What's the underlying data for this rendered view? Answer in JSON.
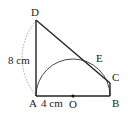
{
  "diagram": {
    "points": {
      "D": {
        "label": "D",
        "x": 36,
        "y": 20
      },
      "A": {
        "label": "A",
        "x": 36,
        "y": 96
      },
      "B": {
        "label": "B",
        "x": 110,
        "y": 96
      },
      "O": {
        "label": "O",
        "x": 73,
        "y": 96
      },
      "C": {
        "label": "C",
        "x": 110,
        "y": 83
      },
      "E": {
        "label": "E",
        "x": 95,
        "y": 63
      }
    },
    "measurements": {
      "AD": "8 cm",
      "AO": "4 cm"
    },
    "colors": {
      "line": "#222222",
      "arc": "#333333",
      "dashed_arc": "#9a9a9a"
    }
  }
}
